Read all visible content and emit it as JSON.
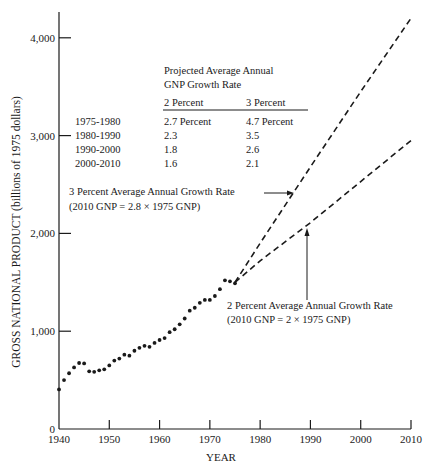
{
  "chart_data": {
    "type": "line",
    "title": "",
    "xlabel": "YEAR",
    "ylabel": "GROSS NATIONAL PRODUCT (billions of 1975 dollars)",
    "xlim": [
      1940,
      2010
    ],
    "ylim": [
      0,
      4300
    ],
    "x_ticks": [
      1940,
      1950,
      1960,
      1970,
      1980,
      1990,
      2000,
      2010
    ],
    "x_tick_labels": [
      "1940",
      "1950",
      "1960",
      "1970",
      "1980",
      "1990",
      "2000",
      "2010"
    ],
    "y_ticks": [
      0,
      1000,
      2000,
      3000,
      4000
    ],
    "y_tick_labels": [
      "0",
      "1,000",
      "2,000",
      "3,000",
      "4,000"
    ],
    "grid": false,
    "series": [
      {
        "name": "Historical GNP",
        "style": "dots",
        "x": [
          1940,
          1941,
          1942,
          1943,
          1944,
          1945,
          1946,
          1947,
          1948,
          1949,
          1950,
          1951,
          1952,
          1953,
          1954,
          1955,
          1956,
          1957,
          1958,
          1959,
          1960,
          1961,
          1962,
          1963,
          1964,
          1965,
          1966,
          1967,
          1968,
          1969,
          1970,
          1971,
          1972,
          1973,
          1974,
          1975
        ],
        "values": [
          405,
          500,
          570,
          630,
          675,
          670,
          590,
          585,
          600,
          610,
          650,
          700,
          720,
          760,
          750,
          800,
          830,
          850,
          840,
          880,
          910,
          930,
          990,
          1020,
          1070,
          1130,
          1210,
          1240,
          1290,
          1320,
          1320,
          1360,
          1430,
          1520,
          1510,
          1490
        ]
      },
      {
        "name": "3 Percent Average Annual Growth Rate",
        "style": "dashed",
        "x": [
          1975,
          1980,
          1990,
          2000,
          2010
        ],
        "values": [
          1500,
          1900,
          2680,
          3450,
          4200
        ]
      },
      {
        "name": "2 Percent Average Annual Growth Rate",
        "style": "dashed",
        "x": [
          1975,
          1980,
          1990,
          2000,
          2010
        ],
        "values": [
          1500,
          1720,
          2110,
          2530,
          2950
        ]
      }
    ],
    "annotations": [
      {
        "text": "3 Percent Average Annual Growth Rate",
        "line2": "(2010 GNP = 2.8 × 1975 GNP)",
        "points_to": "3 Percent series near 1983"
      },
      {
        "text": "2 Percent Average Annual Growth Rate",
        "line2": "(2010 GNP = 2 × 1975 GNP)",
        "points_to": "2 Percent series near 1986"
      }
    ],
    "inset_table": {
      "title_line1": "Projected Average Annual",
      "title_line2": "GNP Growth Rate",
      "columns": [
        "",
        "2 Percent",
        "3 Percent"
      ],
      "rows": [
        [
          "1975-1980",
          "2.7 Percent",
          "4.7 Percent"
        ],
        [
          "1980-1990",
          "2.3",
          "3.5"
        ],
        [
          "1990-2000",
          "1.8",
          "2.6"
        ],
        [
          "2000-2010",
          "1.6",
          "2.1"
        ]
      ]
    }
  },
  "labels": {
    "ylabel": "GROSS NATIONAL PRODUCT (billions of 1975 dollars)",
    "xlabel": "YEAR",
    "table_title_1": "Projected Average Annual",
    "table_title_2": "GNP Growth Rate",
    "col_2pct": "2 Percent",
    "col_3pct": "3 Percent",
    "rows": [
      {
        "period": "1975-1980",
        "p2": "2.7 Percent",
        "p3": "4.7 Percent"
      },
      {
        "period": "1980-1990",
        "p2": "2.3",
        "p3": "3.5"
      },
      {
        "period": "1990-2000",
        "p2": "1.8",
        "p3": "2.6"
      },
      {
        "period": "2000-2010",
        "p2": "1.6",
        "p3": "2.1"
      }
    ],
    "ann3_line1": "3 Percent Average Annual Growth Rate",
    "ann3_line2": "(2010 GNP = 2.8 × 1975 GNP)",
    "ann2_line1": "2 Percent Average Annual Growth Rate",
    "ann2_line2": "(2010 GNP = 2 × 1975 GNP)",
    "yticks": [
      "0",
      "1,000",
      "2,000",
      "3,000",
      "4,000"
    ],
    "xticks": [
      "1940",
      "1950",
      "1960",
      "1970",
      "1980",
      "1990",
      "2000",
      "2010"
    ]
  }
}
